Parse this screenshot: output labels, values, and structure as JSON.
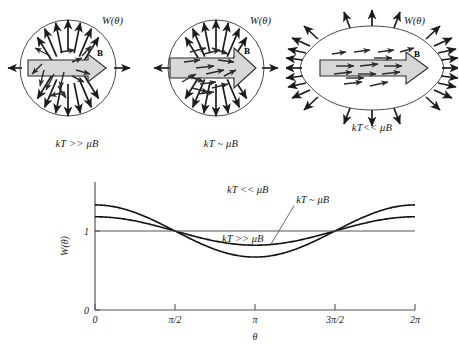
{
  "figure": {
    "title": "",
    "panels": [
      {
        "id": "panel-high-temperature",
        "caption": "kT >> μB",
        "distribution_label": "W(θ)",
        "field_label": "B",
        "shape": "circle",
        "shape_note": "isotropic circular distribution",
        "boundary_arrows": 16,
        "interior_arrows": 12,
        "interior_arrow_order": "random"
      },
      {
        "id": "panel-comparable-temperature",
        "caption": "kT ~ μB",
        "distribution_label": "W(θ)",
        "field_label": "B",
        "shape": "circle",
        "shape_note": "slightly anisotropic distribution",
        "boundary_arrows": 16,
        "interior_arrows": 14,
        "interior_arrow_order": "partially aligned"
      },
      {
        "id": "panel-low-temperature",
        "caption": "kT<< μB",
        "distribution_label": "W(θ)",
        "field_label": "B",
        "shape": "elongated",
        "shape_note": "strongly elongated distribution along B",
        "boundary_arrows": 28,
        "interior_arrows": 14,
        "interior_arrow_order": "strongly aligned"
      }
    ]
  },
  "chart_data": {
    "type": "line",
    "title": "",
    "xlabel": "θ",
    "ylabel": "W(θ)",
    "xlim": [
      0,
      6.283185307179586
    ],
    "ylim": [
      0,
      1.62
    ],
    "grid": false,
    "legend": "inline-annotations",
    "x_ticks": [
      0,
      1.5707963267948966,
      3.141592653589793,
      4.71238898038469,
      6.283185307179586
    ],
    "x_tick_labels": [
      "0",
      "π/2",
      "π",
      "3π/2",
      "2π"
    ],
    "y_ticks": [
      0,
      1
    ],
    "y_tick_labels": [
      "0",
      "1"
    ],
    "formula": "W(theta) = 1 + A*cos(theta)",
    "series": [
      {
        "name": "kT << μB",
        "amplitude": 0.33,
        "baseline": 1.0,
        "max": 1.33,
        "min": 0.67,
        "label_x": 3.0,
        "label_y": 1.48
      },
      {
        "name": "kT ~ μB",
        "amplitude": 0.18,
        "baseline": 1.0,
        "max": 1.18,
        "min": 0.82,
        "label_x": 3.95,
        "label_y": 1.36
      },
      {
        "name": "kT >> μB",
        "amplitude": 0.0,
        "baseline": 1.0,
        "max": 1.0,
        "min": 1.0,
        "label_x": 2.9,
        "label_y": 0.86
      }
    ]
  },
  "colors": {
    "ink": "#1a1a1a",
    "axis": "#555555",
    "curve": "#111111",
    "arrow_fill": "#d7d7d7",
    "arrow_stroke": "#2a2a2a",
    "background": "#ffffff"
  }
}
